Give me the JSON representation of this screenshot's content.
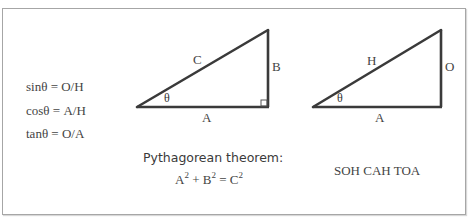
{
  "formulas": {
    "sin": "sinθ = O/H",
    "cos": "cosθ = A/H",
    "tan": "tanθ = O/A"
  },
  "triangle_pythagorean": {
    "hypotenuse_label": "C",
    "vertical_label": "B",
    "base_label": "A",
    "angle_label": "θ",
    "right_angle_marker": true
  },
  "triangle_trig": {
    "hypotenuse_label": "H",
    "vertical_label": "O",
    "base_label": "A",
    "angle_label": "θ"
  },
  "pythagorean": {
    "title": "Pythagorean theorem:",
    "a": "A",
    "b": "B",
    "c": "C",
    "exponent": "2",
    "plus": "+",
    "equals": "="
  },
  "mnemonic": "SOH CAH TOA",
  "colors": {
    "line": "#3a3a3a",
    "text": "#444444",
    "border": "#a6a6a6"
  }
}
